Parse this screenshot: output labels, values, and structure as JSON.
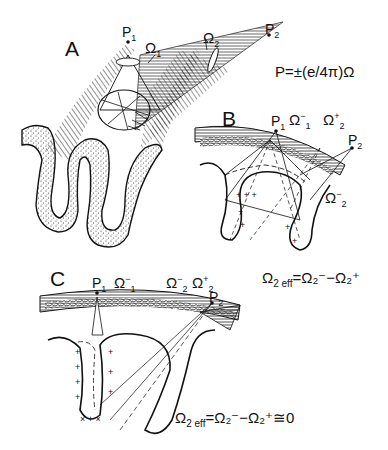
{
  "figure": {
    "panels": [
      {
        "id": "A",
        "label": "A",
        "points": [
          {
            "name": "P",
            "sub": "1"
          },
          {
            "name": "P",
            "sub": "2"
          }
        ],
        "angles": [
          {
            "sym": "Ω",
            "sub": "1",
            "sup": ""
          },
          {
            "sym": "Ω",
            "sub": "2",
            "sup": ""
          }
        ],
        "formula": "P=±(e/4π)Ω"
      },
      {
        "id": "B",
        "label": "B",
        "points": [
          {
            "name": "P",
            "sub": "1"
          },
          {
            "name": "P",
            "sub": "2"
          }
        ],
        "angles": [
          {
            "sym": "Ω",
            "sub": "1",
            "sup": "−"
          },
          {
            "sym": "Ω",
            "sub": "2",
            "sup": "+"
          },
          {
            "sym": "Ω",
            "sub": "2",
            "sup": "−"
          }
        ],
        "equation": {
          "lhs": "Ω",
          "lhs_sub": "2 eff",
          "rhs": "=Ω₂⁻−Ω₂⁺"
        }
      },
      {
        "id": "C",
        "label": "C",
        "points": [
          {
            "name": "P",
            "sub": "1"
          },
          {
            "name": "P",
            "sub": "2"
          }
        ],
        "angles": [
          {
            "sym": "Ω",
            "sub": "1",
            "sup": "−"
          },
          {
            "sym": "Ω",
            "sub": "2",
            "sup": "−"
          },
          {
            "sym": "Ω",
            "sub": "2",
            "sup": "+"
          }
        ],
        "equation": {
          "lhs": "Ω",
          "lhs_sub": "2 eff",
          "rhs": "=Ω₂⁻−Ω₂⁺≅0"
        }
      }
    ]
  }
}
